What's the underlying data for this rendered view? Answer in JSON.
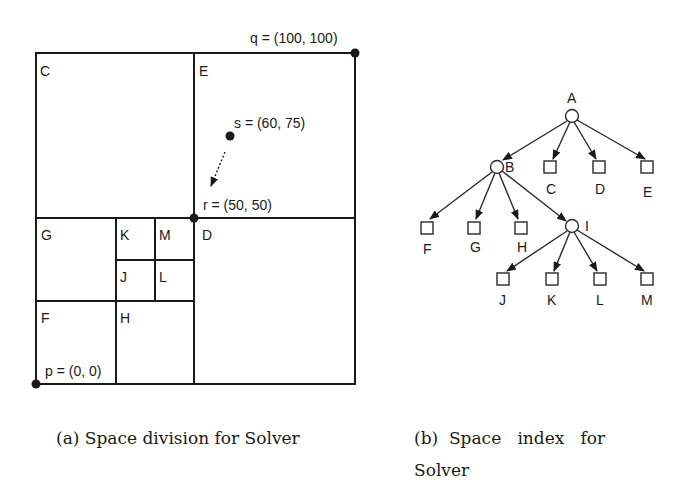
{
  "panel_a": {
    "regions": {
      "C": "C",
      "E": "E",
      "G": "G",
      "K": "K",
      "M": "M",
      "D": "D",
      "J": "J",
      "L": "L",
      "F": "F",
      "H": "H"
    },
    "points": {
      "q": "q = (100, 100)",
      "s": "s = (60, 75)",
      "r": "r = (50, 50)",
      "p": "p = (0, 0)"
    },
    "caption": "(a) Space division for Solver"
  },
  "panel_b": {
    "nodes": {
      "A": "A",
      "B": "B",
      "C": "C",
      "D": "D",
      "E": "E",
      "F": "F",
      "G": "G",
      "H": "H",
      "I": "I",
      "J": "J",
      "K": "K",
      "L": "L",
      "M": "M"
    },
    "caption_line1": "(b)  Space   index   for",
    "caption_line2": "Solver"
  },
  "colors": {
    "ink": "#1a1a1a",
    "background": "#ffffff"
  }
}
